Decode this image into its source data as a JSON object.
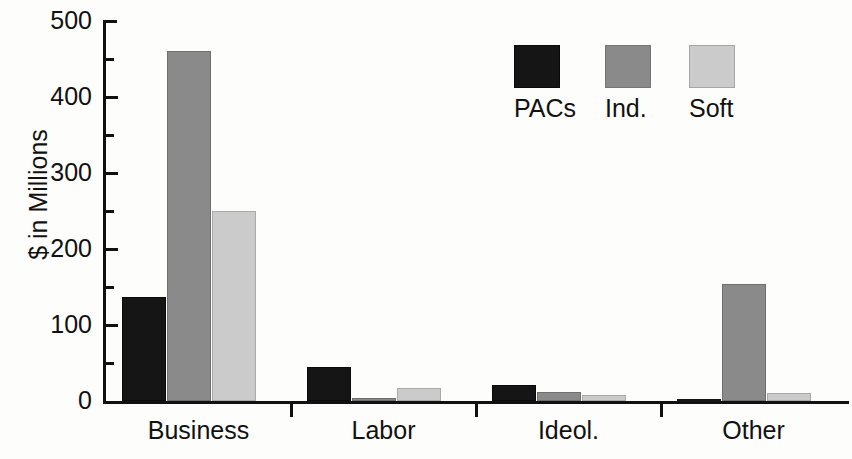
{
  "chart_data": {
    "type": "bar",
    "title": "",
    "subtitle": "",
    "xlabel": "",
    "ylabel": "$ in Millions",
    "categories": [
      "Business",
      "Labor",
      "Ideol.",
      "Other"
    ],
    "series": [
      {
        "name": "PACs",
        "color": "#151515",
        "values": [
          138,
          45,
          22,
          3
        ]
      },
      {
        "name": "Ind.",
        "color": "#8a8a8a",
        "values": [
          461,
          5,
          12,
          155
        ]
      },
      {
        "name": "Soft",
        "color": "#cbcbcb",
        "values": [
          251,
          18,
          8,
          11
        ]
      }
    ],
    "ylim": [
      0,
      500
    ],
    "y_major_ticks": [
      0,
      100,
      200,
      300,
      400,
      500
    ],
    "y_minor_ticks": [
      50,
      150,
      250,
      350,
      450
    ],
    "y_tick_labels": [
      "0",
      "100",
      "200",
      "300",
      "400",
      "500"
    ],
    "grid": false,
    "legend_position": "inside-top-right",
    "legend_entries": [
      "PACs",
      "Ind.",
      "Soft"
    ]
  },
  "axis": {
    "y_title": "$ in Millions"
  },
  "legend": {
    "entries": [
      {
        "label": "PACs",
        "swatch": "pacs"
      },
      {
        "label": "Ind.",
        "swatch": "ind"
      },
      {
        "label": "Soft",
        "swatch": "soft"
      }
    ]
  }
}
